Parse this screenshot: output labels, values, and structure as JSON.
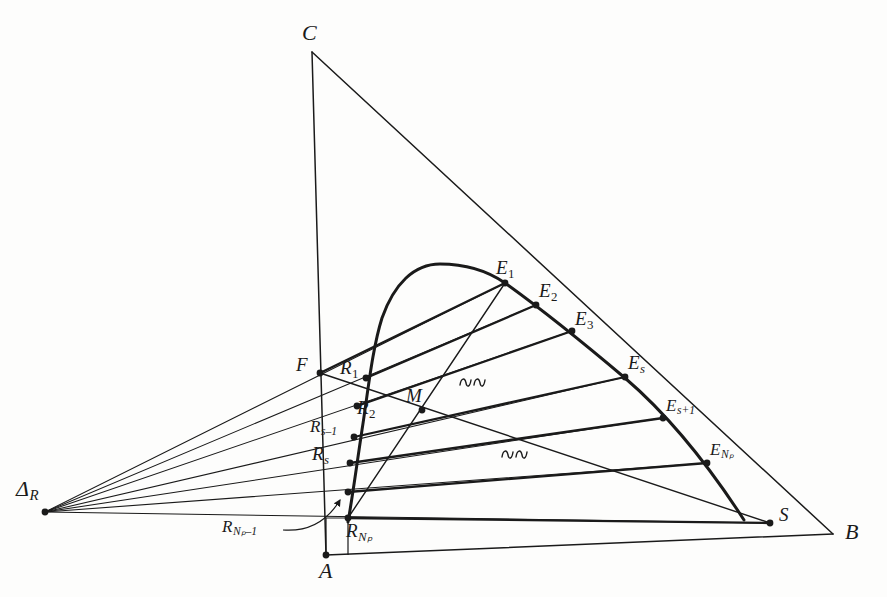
{
  "figure": {
    "type": "ternary-phase-diagram",
    "background_color": "#fdfdfc",
    "line_color": "#1a1a1a"
  },
  "vertices": [
    {
      "id": "C",
      "label": "C",
      "x": 312,
      "y": 52,
      "label_x": 302,
      "label_y": 22
    },
    {
      "id": "A",
      "label": "A",
      "x": 326,
      "y": 555,
      "label_x": 319,
      "label_y": 560
    },
    {
      "id": "B",
      "label": "B",
      "x": 833,
      "y": 534,
      "label_x": 845,
      "label_y": 521
    }
  ],
  "difference_point": {
    "id": "DeltaR",
    "label_main": "Δ",
    "label_sub": "R",
    "x": 45,
    "y": 512,
    "label_x": 16,
    "label_y": 478
  },
  "raffinate_points": [
    {
      "id": "F",
      "main": "F",
      "sub": "",
      "sub_italic": true,
      "x": 320,
      "y": 373,
      "label_x": 296,
      "label_y": 355,
      "size": "pt"
    },
    {
      "id": "R1",
      "main": "R",
      "sub": "1",
      "sub_italic": false,
      "x": 366,
      "y": 378,
      "label_x": 340,
      "label_y": 358,
      "size": "pt"
    },
    {
      "id": "R2",
      "main": "R",
      "sub": "2",
      "sub_italic": false,
      "x": 357,
      "y": 406,
      "label_x": 357,
      "label_y": 398,
      "size": "pt"
    },
    {
      "id": "Rs-1",
      "main": "R",
      "sub": "s–1",
      "sub_italic": true,
      "x": 354,
      "y": 437,
      "label_x": 310,
      "label_y": 418,
      "size": "ptsm"
    },
    {
      "id": "Rs",
      "main": "R",
      "sub": "s",
      "sub_italic": true,
      "x": 350,
      "y": 463,
      "label_x": 312,
      "label_y": 444,
      "size": "pt"
    },
    {
      "id": "RNp-1",
      "main": "R",
      "sub": "Nₚ–1",
      "sub_italic": true,
      "x": 348,
      "y": 492,
      "label_x": 222,
      "label_y": 518,
      "size": "ptsm"
    },
    {
      "id": "RNp",
      "main": "R",
      "sub": "Nₚ",
      "sub_italic": true,
      "x": 348,
      "y": 518,
      "label_x": 346,
      "label_y": 521,
      "size": "pt"
    }
  ],
  "extract_points": [
    {
      "id": "E1",
      "main": "E",
      "sub": "1",
      "sub_italic": false,
      "x": 505,
      "y": 283,
      "label_x": 496,
      "label_y": 258,
      "size": "pt"
    },
    {
      "id": "E2",
      "main": "E",
      "sub": "2",
      "sub_italic": false,
      "x": 536,
      "y": 305,
      "label_x": 539,
      "label_y": 281,
      "size": "pt"
    },
    {
      "id": "E3",
      "main": "E",
      "sub": "3",
      "sub_italic": false,
      "x": 572,
      "y": 331,
      "label_x": 575,
      "label_y": 309,
      "size": "pt"
    },
    {
      "id": "Es",
      "main": "E",
      "sub": "s",
      "sub_italic": true,
      "x": 625,
      "y": 377,
      "label_x": 628,
      "label_y": 353,
      "size": "pt"
    },
    {
      "id": "Es+1",
      "main": "E",
      "sub": "s+1",
      "sub_italic": true,
      "x": 663,
      "y": 418,
      "label_x": 666,
      "label_y": 397,
      "size": "ptsm"
    },
    {
      "id": "ENp",
      "main": "E",
      "sub": "Nₚ",
      "sub_italic": true,
      "x": 707,
      "y": 463,
      "label_x": 710,
      "label_y": 441,
      "size": "ptsm"
    }
  ],
  "other_points": [
    {
      "id": "M",
      "main": "M",
      "sub": "",
      "sub_italic": false,
      "x": 422,
      "y": 410,
      "label_x": 406,
      "label_y": 386,
      "size": "pt"
    },
    {
      "id": "S",
      "main": "S",
      "sub": "",
      "sub_italic": false,
      "x": 770,
      "y": 523,
      "label_x": 779,
      "label_y": 505,
      "size": "pt"
    }
  ],
  "ellipsis_marks": [
    {
      "id": "break-upper",
      "x": 460,
      "y": 385
    },
    {
      "id": "break-lower",
      "x": 502,
      "y": 457
    }
  ],
  "geometry": {
    "triangle_edges": [
      {
        "name": "edge-CA",
        "from": [
          312,
          52
        ],
        "to": [
          326,
          555
        ]
      },
      {
        "name": "edge-CB",
        "from": [
          312,
          52
        ],
        "to": [
          833,
          534
        ]
      },
      {
        "name": "edge-AB",
        "from": [
          326,
          555
        ],
        "to": [
          833,
          534
        ]
      }
    ],
    "binodal_curve": "M 348,522 C 352,500 356,470 362,430 C 368,392 372,350 382,318 C 394,284 414,264 440,264 C 470,264 492,274 505,283 C 540,308 580,340 625,378 C 660,408 700,452 744,520",
    "tie_lines": [
      {
        "name": "tie-F-E1",
        "from": [
          320,
          373
        ],
        "to": [
          505,
          283
        ]
      },
      {
        "name": "tie-R1-E2",
        "from": [
          366,
          378
        ],
        "to": [
          536,
          305
        ]
      },
      {
        "name": "tie-R2-E3",
        "from": [
          357,
          406
        ],
        "to": [
          572,
          331
        ]
      },
      {
        "name": "tie-Rs1-Es",
        "from": [
          354,
          437
        ],
        "to": [
          625,
          377
        ]
      },
      {
        "name": "tie-Rs-Es1",
        "from": [
          350,
          463
        ],
        "to": [
          663,
          418
        ]
      },
      {
        "name": "tie-RNp1-ENp",
        "from": [
          348,
          492
        ],
        "to": [
          707,
          463
        ]
      },
      {
        "name": "tie-RNp-S",
        "from": [
          348,
          518
        ],
        "to": [
          770,
          523
        ]
      }
    ],
    "delta_rays": [
      {
        "name": "ray-to-E1",
        "from": [
          45,
          512
        ],
        "to": [
          505,
          283
        ]
      },
      {
        "name": "ray-to-E2",
        "from": [
          45,
          512
        ],
        "to": [
          536,
          305
        ]
      },
      {
        "name": "ray-to-E3",
        "from": [
          45,
          512
        ],
        "to": [
          572,
          331
        ]
      },
      {
        "name": "ray-to-Es",
        "from": [
          45,
          512
        ],
        "to": [
          625,
          377
        ]
      },
      {
        "name": "ray-to-Es1",
        "from": [
          45,
          512
        ],
        "to": [
          663,
          418
        ]
      },
      {
        "name": "ray-to-ENp",
        "from": [
          45,
          512
        ],
        "to": [
          707,
          463
        ]
      },
      {
        "name": "ray-to-S",
        "from": [
          45,
          512
        ],
        "to": [
          770,
          523
        ]
      }
    ],
    "mixture_line": {
      "name": "line-E1-M-RNp",
      "from": [
        505,
        283
      ],
      "to": [
        348,
        518
      ]
    },
    "feed_line": {
      "name": "line-F-M-S",
      "from": [
        320,
        373
      ],
      "to": [
        770,
        523
      ]
    },
    "pointer_arrow": {
      "name": "arrow-to-RNp-minus-1",
      "path": "M 283,530 C 310,532 328,520 340,500",
      "tip": [
        345,
        494
      ]
    },
    "base_box": {
      "name": "box-near-A",
      "points": "326,555 326,518 348,518 348,555"
    }
  }
}
